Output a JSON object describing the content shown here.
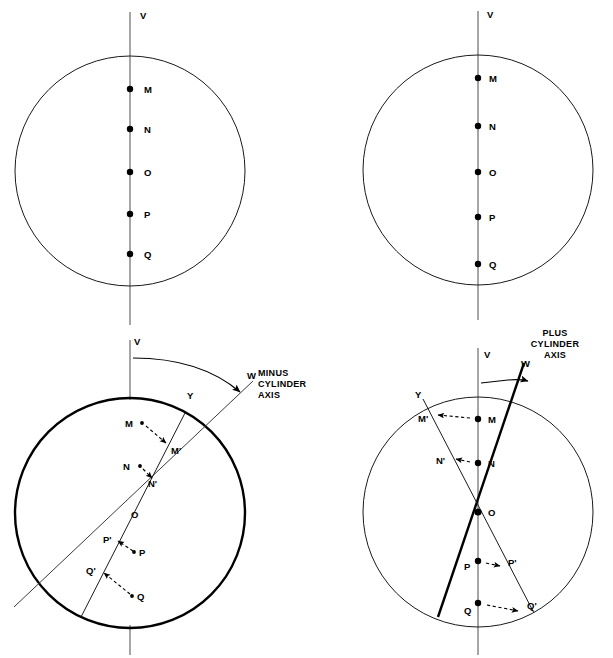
{
  "figure": {
    "background_color": "#ffffff",
    "ink_color": "#000000",
    "width": 613,
    "height": 658
  },
  "panels": [
    {
      "id": "top-left",
      "name": "top-left-reference-circle",
      "vertical_axis_label": "V",
      "circle": {
        "cx": 130,
        "cy": 171,
        "r": 115,
        "stroke": "thin"
      },
      "points": [
        {
          "label": "M",
          "x": 130,
          "y": 89
        },
        {
          "label": "N",
          "x": 130,
          "y": 129
        },
        {
          "label": "O",
          "x": 130,
          "y": 172
        },
        {
          "label": "P",
          "x": 130,
          "y": 214
        },
        {
          "label": "Q",
          "x": 130,
          "y": 254
        }
      ]
    },
    {
      "id": "top-right",
      "name": "top-right-reference-circle",
      "vertical_axis_label": "V",
      "circle": {
        "cx": 478,
        "cy": 170,
        "r": 115,
        "stroke": "thin"
      },
      "points": [
        {
          "label": "M",
          "x": 478,
          "y": 78
        },
        {
          "label": "N",
          "x": 478,
          "y": 126
        },
        {
          "label": "O",
          "x": 478,
          "y": 172
        },
        {
          "label": "P",
          "x": 478,
          "y": 217
        },
        {
          "label": "Q",
          "x": 478,
          "y": 264
        }
      ]
    },
    {
      "id": "bottom-left",
      "name": "minus-cylinder-panel",
      "vertical_axis_label": "V",
      "rotated_axis_label": "W",
      "chord_label": "Y",
      "center_label": "O",
      "caption": [
        "MINUS",
        "CYLINDER",
        "AXIS"
      ],
      "circle": {
        "cx": 130,
        "cy": 513,
        "r": 115,
        "stroke": "thick"
      },
      "points": [
        {
          "label": "M",
          "x": 131,
          "y": 425
        },
        {
          "label": "M'",
          "x": 166,
          "y": 450
        },
        {
          "label": "N",
          "x": 130,
          "y": 468
        },
        {
          "label": "N'",
          "x": 149,
          "y": 482
        },
        {
          "label": "O",
          "x": 135,
          "y": 514
        },
        {
          "label": "P'",
          "x": 110,
          "y": 539
        },
        {
          "label": "P",
          "x": 139,
          "y": 551
        },
        {
          "label": "Q'",
          "x": 94,
          "y": 570
        },
        {
          "label": "Q",
          "x": 139,
          "y": 597
        }
      ]
    },
    {
      "id": "bottom-right",
      "name": "plus-cylinder-panel",
      "vertical_axis_label": "V",
      "rotated_axis_label": "W",
      "chord_label": "Y",
      "center_label": "O",
      "caption": [
        "PLUS",
        "CYLINDER",
        "AXIS"
      ],
      "circle": {
        "cx": 478,
        "cy": 512,
        "r": 115,
        "stroke": "thin"
      },
      "points": [
        {
          "label": "M",
          "x": 478,
          "y": 419
        },
        {
          "label": "M'",
          "x": 423,
          "y": 418
        },
        {
          "label": "N",
          "x": 478,
          "y": 463
        },
        {
          "label": "N'",
          "x": 443,
          "y": 460
        },
        {
          "label": "O",
          "x": 478,
          "y": 512
        },
        {
          "label": "P",
          "x": 478,
          "y": 561
        },
        {
          "label": "P'",
          "x": 512,
          "y": 562
        },
        {
          "label": "Q",
          "x": 478,
          "y": 603
        },
        {
          "label": "Q'",
          "x": 532,
          "y": 606
        }
      ]
    }
  ]
}
